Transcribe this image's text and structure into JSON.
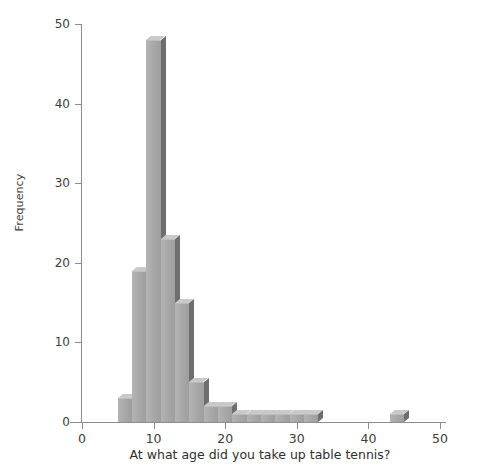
{
  "chart_data": {
    "type": "bar",
    "title": "",
    "subtitle": "",
    "xlabel": "At what age did you take up table tennis?",
    "ylabel": "Frequency",
    "xlim": [
      -2,
      52
    ],
    "ylim": [
      0,
      50
    ],
    "xticks": [
      0,
      10,
      20,
      30,
      40,
      50
    ],
    "yticks": [
      0,
      10,
      20,
      30,
      40,
      50
    ],
    "grid": false,
    "legend": null,
    "bin_width": 2,
    "categories": [
      "5-7",
      "7-9",
      "9-11",
      "11-13",
      "13-15",
      "15-17",
      "17-19",
      "19-21",
      "21-23",
      "23-25",
      "25-27",
      "27-29",
      "29-31",
      "31-33",
      "43-45"
    ],
    "bins": [
      {
        "start": 5,
        "end": 7,
        "value": 3
      },
      {
        "start": 7,
        "end": 9,
        "value": 19
      },
      {
        "start": 9,
        "end": 11,
        "value": 48
      },
      {
        "start": 11,
        "end": 13,
        "value": 23
      },
      {
        "start": 13,
        "end": 15,
        "value": 15
      },
      {
        "start": 15,
        "end": 17,
        "value": 5
      },
      {
        "start": 17,
        "end": 19,
        "value": 2
      },
      {
        "start": 19,
        "end": 21,
        "value": 2
      },
      {
        "start": 21,
        "end": 23,
        "value": 1
      },
      {
        "start": 23,
        "end": 25,
        "value": 1
      },
      {
        "start": 25,
        "end": 27,
        "value": 1
      },
      {
        "start": 27,
        "end": 29,
        "value": 1
      },
      {
        "start": 29,
        "end": 31,
        "value": 1
      },
      {
        "start": 31,
        "end": 33,
        "value": 1
      },
      {
        "start": 43,
        "end": 45,
        "value": 1
      }
    ],
    "values": [
      3,
      19,
      48,
      23,
      15,
      5,
      2,
      2,
      1,
      1,
      1,
      1,
      1,
      1,
      1
    ],
    "colors": {
      "bar_face": "#a9a9a9",
      "bar_side": "#6e6e6e",
      "bar_top": "#c9c9c9",
      "axis": "#8c8c8c",
      "text": "#3d3d3d",
      "background": "#ffffff"
    }
  }
}
